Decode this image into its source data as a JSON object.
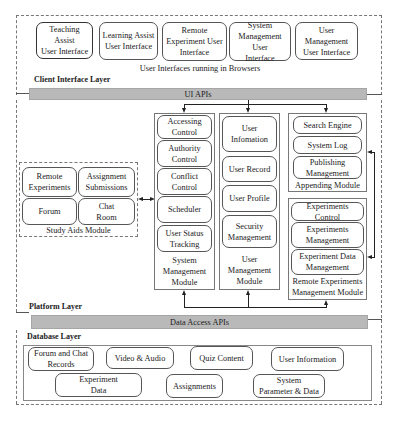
{
  "client_layer": {
    "label": "Client Interface Layer",
    "interfaces": [
      {
        "label": "Teaching Assist\nUser Interface"
      },
      {
        "label": "Learning Assist\nUser Interface"
      },
      {
        "label": "Remote\nExperiment User\nInterface"
      },
      {
        "label": "System\nManagement User\nInterface"
      },
      {
        "label": "User Management\nUser Interface"
      }
    ],
    "caption": "User Interfaces running in Browsers",
    "api_bar": "UI APIs"
  },
  "platform_layer": {
    "label": "Platform Layer",
    "study_aids": {
      "title": "Study Aids Module",
      "items": [
        "Remote\nExperiments",
        "Assignment\nSubmissions",
        "Forum",
        "Chat\nRoom"
      ]
    },
    "system_management": {
      "title": "System\nManagement\nModule",
      "items": [
        "Accessing\nControl",
        "Authority\nControl",
        "Conflict\nControl",
        "Scheduler",
        "User Status\nTracking"
      ]
    },
    "user_management": {
      "title": "User\nManagement\nModule",
      "items": [
        "User\nInfomation",
        "User Record",
        "User Profile",
        "Security\nManagement"
      ]
    },
    "appending": {
      "title": "Appending Module",
      "items": [
        "Search Engine",
        "System Log",
        "Publishing\nManagement"
      ]
    },
    "remote_experiments": {
      "title": "Remote Experiments\nManagement Module",
      "items": [
        "Experiments Control",
        "Experiments\nManagement",
        "Experiment Data\nManagement"
      ]
    },
    "api_bar": "Data Access APIs"
  },
  "database_layer": {
    "label": "Database Layer",
    "row1": [
      "Forum and Chat\nRecords",
      "Video & Audio",
      "Quiz Content",
      "User Information"
    ],
    "row2": [
      "Experiment\nData",
      "Assignments",
      "System\nParameter & Data"
    ]
  }
}
